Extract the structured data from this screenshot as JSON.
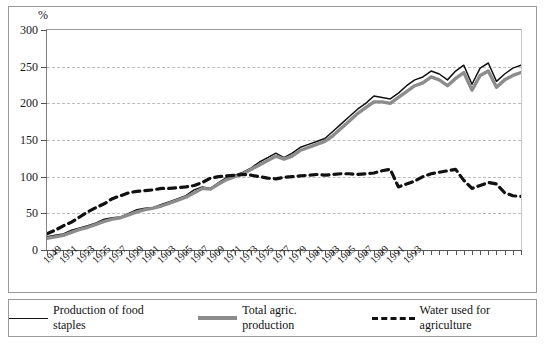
{
  "axis": {
    "unit_label": "%",
    "y_ticks": [
      0,
      50,
      100,
      150,
      200,
      250,
      300
    ],
    "ylim": [
      0,
      300
    ],
    "x_labels": [
      "1949",
      "1951",
      "1953",
      "1955",
      "1957",
      "1959",
      "1961",
      "1963",
      "1965",
      "1967",
      "1969",
      "1971",
      "1973",
      "1975",
      "1977",
      "1979",
      "1981",
      "1983",
      "1985",
      "1987",
      "1989",
      "1991",
      "1993"
    ]
  },
  "legend": {
    "items": [
      {
        "label": "Production of food staples",
        "style": "solid-thin",
        "color": "#111111"
      },
      {
        "label": "Total agric. production",
        "style": "solid-thick",
        "color": "#8c8c8c"
      },
      {
        "label": "Water used for agriculture",
        "style": "dashed",
        "color": "#111111"
      }
    ]
  },
  "chart_data": {
    "type": "line",
    "title": "",
    "xlabel": "",
    "ylabel": "%",
    "ylim": [
      0,
      300
    ],
    "xlim": [
      1949,
      1994
    ],
    "grid": true,
    "legend_position": "bottom",
    "x": [
      1949,
      1950,
      1951,
      1952,
      1953,
      1954,
      1955,
      1956,
      1957,
      1958,
      1959,
      1960,
      1961,
      1962,
      1963,
      1964,
      1965,
      1966,
      1967,
      1968,
      1969,
      1970,
      1971,
      1972,
      1973,
      1974,
      1975,
      1976,
      1977,
      1978,
      1979,
      1980,
      1981,
      1982,
      1983,
      1984,
      1985,
      1986,
      1987,
      1988,
      1989,
      1990,
      1991,
      1992,
      1993,
      1994
    ],
    "series": [
      {
        "name": "Production of food staples",
        "color": "#111111",
        "style": "solid-thin",
        "values": [
          18,
          20,
          22,
          27,
          30,
          33,
          37,
          42,
          44,
          45,
          50,
          55,
          57,
          58,
          62,
          66,
          70,
          74,
          82,
          86,
          84,
          92,
          99,
          102,
          106,
          112,
          120,
          126,
          132,
          126,
          132,
          140,
          144,
          148,
          152,
          162,
          172,
          182,
          192,
          200,
          210,
          208,
          206,
          214,
          224,
          232
        ]
      },
      {
        "name": "Total agric. production",
        "color": "#8c8c8c",
        "style": "solid-thick",
        "values": [
          16,
          18,
          20,
          24,
          28,
          31,
          35,
          39,
          42,
          44,
          48,
          52,
          55,
          57,
          60,
          64,
          68,
          72,
          78,
          84,
          83,
          90,
          96,
          100,
          104,
          110,
          116,
          122,
          128,
          124,
          128,
          136,
          140,
          144,
          148,
          156,
          166,
          176,
          186,
          194,
          202,
          202,
          200,
          208,
          216,
          224
        ]
      },
      {
        "name": "Water used for agriculture",
        "color": "#111111",
        "style": "dashed",
        "values": [
          22,
          27,
          33,
          38,
          45,
          52,
          58,
          63,
          70,
          74,
          78,
          80,
          81,
          82,
          84,
          84,
          85,
          86,
          88,
          92,
          98,
          100,
          101,
          102,
          103,
          102,
          100,
          98,
          97,
          99,
          100,
          101,
          102,
          103,
          102,
          103,
          104,
          104,
          103,
          104,
          105,
          108,
          110,
          86,
          90,
          94
        ]
      }
    ],
    "series_tail": {
      "Production of food staples": [
        236,
        244,
        240,
        232,
        244,
        252,
        226,
        248,
        255,
        230,
        240,
        248,
        252
      ],
      "Total agric. production": [
        228,
        236,
        232,
        224,
        234,
        242,
        218,
        238,
        244,
        222,
        232,
        238,
        242
      ],
      "Water used for agriculture": [
        100,
        104,
        106,
        108,
        110,
        95,
        84,
        88,
        92,
        90,
        78,
        74,
        73
      ]
    }
  }
}
